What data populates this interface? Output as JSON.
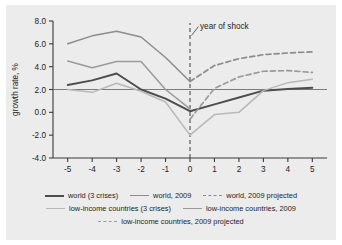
{
  "chart_data": {
    "type": "line",
    "title": "",
    "xlabel": "",
    "ylabel": "growth rate, %",
    "xlim": [
      -5.6,
      5.6
    ],
    "ylim": [
      -4.0,
      8.0
    ],
    "x": [
      -5,
      -4,
      -3,
      -2,
      -1,
      0,
      1,
      2,
      3,
      4,
      5
    ],
    "xticklabels": [
      "-5",
      "-4",
      "-3",
      "-2",
      "-1",
      "0",
      "1",
      "2",
      "3",
      "4",
      "5"
    ],
    "yticks": [
      -4.0,
      -2.0,
      0.0,
      2.0,
      4.0,
      6.0,
      8.0
    ],
    "yticklabels": [
      "-4.0",
      "-2.0",
      "0.0",
      "2.0",
      "4.0",
      "6.0",
      "8.0"
    ],
    "grid": false,
    "reference_line_y": 2.0,
    "legend_position": "below",
    "annotations": [
      {
        "text": "year of shock",
        "x": 0,
        "y": 7.3,
        "marker": "dashed-vertical-line-at-x-0"
      }
    ],
    "series": [
      {
        "name": "world (3 crises)",
        "style": "solid",
        "color": "#4d4d4d",
        "width": 2.0,
        "x": [
          -5,
          -4,
          -3,
          -2,
          -1,
          0,
          1,
          2,
          3,
          4,
          5
        ],
        "values": [
          2.4,
          2.8,
          3.4,
          2.0,
          1.2,
          0.1,
          0.7,
          1.3,
          1.9,
          2.05,
          2.15
        ]
      },
      {
        "name": "world, 2009",
        "style": "solid",
        "color": "#8c8c8c",
        "width": 1.5,
        "x": [
          -5,
          -4,
          -3,
          -2,
          -1,
          0
        ],
        "values": [
          6.0,
          6.7,
          7.1,
          6.6,
          4.8,
          2.7
        ]
      },
      {
        "name": "world, 2009 projected",
        "style": "dashed",
        "color": "#8c8c8c",
        "width": 1.7,
        "x": [
          0,
          1,
          2,
          3,
          4,
          5
        ],
        "values": [
          2.7,
          4.1,
          4.7,
          5.05,
          5.2,
          5.3
        ]
      },
      {
        "name": "low-income countries (3 crises)",
        "style": "solid",
        "color": "#b8b8b8",
        "width": 1.5,
        "x": [
          -5,
          -4,
          -3,
          -2,
          -1,
          0,
          1,
          2,
          3,
          4,
          5
        ],
        "values": [
          2.0,
          1.75,
          2.55,
          1.85,
          0.9,
          -2.0,
          -0.2,
          0.0,
          1.9,
          2.6,
          2.9
        ]
      },
      {
        "name": "low-income countries, 2009",
        "style": "solid",
        "color": "#9a9a9a",
        "width": 1.5,
        "x": [
          -5,
          -4,
          -3,
          -2,
          -1,
          0
        ],
        "values": [
          4.5,
          3.9,
          4.45,
          4.45,
          2.0,
          0.3
        ]
      },
      {
        "name": "low-income countries, 2009 projected",
        "style": "dashed",
        "color": "#9a9a9a",
        "width": 1.7,
        "x": [
          0,
          1,
          2,
          3,
          4,
          5
        ],
        "values": [
          -0.6,
          2.1,
          3.1,
          3.6,
          3.65,
          3.5
        ]
      }
    ]
  },
  "legend": {
    "rows": [
      [
        {
          "label": "world (3 crises)",
          "style": "solid",
          "color": "#4d4d4d",
          "width": 2.0
        },
        {
          "label": "world, 2009",
          "style": "solid",
          "color": "#8c8c8c",
          "width": 1.5
        },
        {
          "label": "world, 2009 projected",
          "style": "dashed",
          "color": "#8c8c8c",
          "width": 1.5
        }
      ],
      [
        {
          "label": "low-income countries (3 crises)",
          "style": "solid",
          "color": "#b8b8b8",
          "width": 1.5
        },
        {
          "label": "low-income countries, 2009",
          "style": "solid",
          "color": "#9a9a9a",
          "width": 1.5
        }
      ],
      [
        {
          "label": "low-income countries, 2009 projected",
          "style": "dashed",
          "color": "#9a9a9a",
          "width": 1.5
        }
      ]
    ]
  },
  "colors": {
    "background": "#ececec",
    "page": "#ffffff",
    "axis": "#3a3a3a",
    "text": "#1c1c1c"
  }
}
